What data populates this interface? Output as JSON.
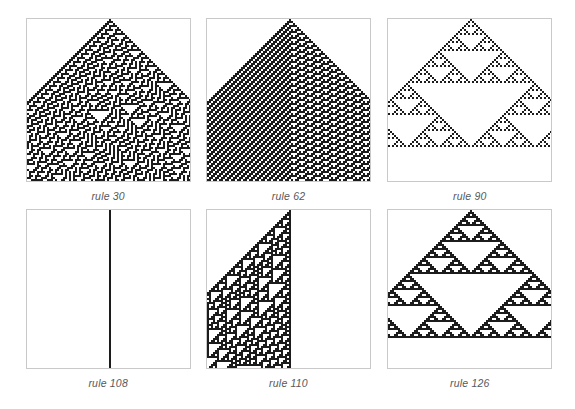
{
  "figure": {
    "background_color": "#ffffff",
    "cell_color": "#1c1c1c",
    "frame_color": "#c9c9c9",
    "caption_color": "#585858",
    "columns": 3,
    "rows": 2
  },
  "panels": [
    {
      "id": "panel-rule-30",
      "caption": "rule 30",
      "rule": 30,
      "steps": 81,
      "width_cells": 163,
      "initial_condition": "single black cell at center",
      "growth": "both sides",
      "description": "random-looking chaotic pattern filling a triangle that widens to the panel edges",
      "chart_data": {
        "type": "heatmap",
        "rule_binary": "00011110",
        "neighborhoods": [
          "111",
          "110",
          "101",
          "100",
          "011",
          "010",
          "001",
          "000"
        ],
        "outputs": [
          0,
          0,
          0,
          1,
          1,
          1,
          1,
          0
        ]
      }
    },
    {
      "id": "panel-rule-62",
      "caption": "rule 62",
      "rule": 62,
      "steps": 81,
      "width_cells": 163,
      "initial_condition": "single black cell at center",
      "growth": "both sides",
      "description": "regular diagonal striped region on the left with a textured triangular region on the right separated by a vertical seam",
      "chart_data": {
        "type": "heatmap",
        "rule_binary": "00111110",
        "neighborhoods": [
          "111",
          "110",
          "101",
          "100",
          "011",
          "010",
          "001",
          "000"
        ],
        "outputs": [
          0,
          0,
          1,
          1,
          1,
          1,
          1,
          0
        ]
      }
    },
    {
      "id": "panel-rule-90",
      "caption": "rule 90",
      "rule": 90,
      "steps": 81,
      "width_cells": 163,
      "initial_condition": "single black cell at center",
      "growth": "both sides",
      "description": "nested Sierpinski-triangle fractal pattern, symmetric about the center",
      "chart_data": {
        "type": "heatmap",
        "rule_binary": "01011010",
        "neighborhoods": [
          "111",
          "110",
          "101",
          "100",
          "011",
          "010",
          "001",
          "000"
        ],
        "outputs": [
          0,
          1,
          0,
          1,
          1,
          0,
          1,
          0
        ]
      }
    },
    {
      "id": "panel-rule-108",
      "caption": "rule 108",
      "rule": 108,
      "steps": 81,
      "width_cells": 163,
      "initial_condition": "single black cell at center",
      "growth": "none",
      "description": "nearly blank panel with a thin broken vertical line of cells down the middle",
      "chart_data": {
        "type": "heatmap",
        "rule_binary": "01101100",
        "neighborhoods": [
          "111",
          "110",
          "101",
          "100",
          "011",
          "010",
          "001",
          "000"
        ],
        "outputs": [
          0,
          1,
          1,
          0,
          1,
          1,
          0,
          0
        ]
      }
    },
    {
      "id": "panel-rule-110",
      "caption": "rule 110",
      "rule": 110,
      "steps": 81,
      "width_cells": 163,
      "initial_condition": "single black cell at center",
      "growth": "left only",
      "description": "right triangle growing only to the left, filled with nested triangular structures",
      "chart_data": {
        "type": "heatmap",
        "rule_binary": "01101110",
        "neighborhoods": [
          "111",
          "110",
          "101",
          "100",
          "011",
          "010",
          "001",
          "000"
        ],
        "outputs": [
          0,
          1,
          1,
          0,
          1,
          1,
          1,
          0
        ]
      }
    },
    {
      "id": "panel-rule-126",
      "caption": "rule 126",
      "rule": 126,
      "steps": 81,
      "width_cells": 163,
      "initial_condition": "single black cell at center",
      "growth": "both sides",
      "description": "symmetric nested pattern of large and small white triangles on a dense black ground",
      "chart_data": {
        "type": "heatmap",
        "rule_binary": "01111110",
        "neighborhoods": [
          "111",
          "110",
          "101",
          "100",
          "011",
          "010",
          "001",
          "000"
        ],
        "outputs": [
          0,
          1,
          1,
          1,
          1,
          1,
          1,
          0
        ]
      }
    }
  ]
}
